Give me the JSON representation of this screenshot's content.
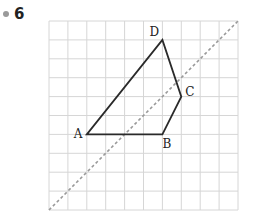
{
  "exercise": {
    "number": "6",
    "bullet_color": "#9a9a9a"
  },
  "grid": {
    "cols": 10,
    "rows": 10,
    "left": 49,
    "top": 21,
    "cell": 18.9,
    "line_color": "#d6d6d6"
  },
  "quadrilateral": {
    "stroke": "#2a2a2a",
    "vertices": [
      {
        "name": "A",
        "col": 2,
        "row": 6
      },
      {
        "name": "B",
        "col": 6,
        "row": 6
      },
      {
        "name": "C",
        "col": 7,
        "row": 4
      },
      {
        "name": "D",
        "col": 6,
        "row": 1
      }
    ],
    "labels": {
      "A": "A",
      "B": "B",
      "C": "C",
      "D": "D"
    }
  },
  "symmetry_axis": {
    "style": "dashed",
    "color": "#9a9a9a",
    "from": {
      "col": 0,
      "row": 10
    },
    "to": {
      "col": 10,
      "row": 0
    }
  }
}
